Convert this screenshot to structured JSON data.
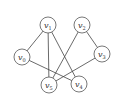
{
  "graph": {
    "nodes": [
      {
        "id": "v0",
        "label": "v",
        "sub": "0",
        "x": 22,
        "y": 57
      },
      {
        "id": "v1",
        "label": "v",
        "sub": "1",
        "x": 48,
        "y": 25
      },
      {
        "id": "v2",
        "label": "v",
        "sub": "2",
        "x": 82,
        "y": 25
      },
      {
        "id": "v3",
        "label": "v",
        "sub": "3",
        "x": 102,
        "y": 54
      },
      {
        "id": "v4",
        "label": "v",
        "sub": "4",
        "x": 79,
        "y": 84
      },
      {
        "id": "v5",
        "label": "v",
        "sub": "5",
        "x": 49,
        "y": 85
      }
    ],
    "edges": [
      [
        "v0",
        "v1"
      ],
      [
        "v0",
        "v4"
      ],
      [
        "v1",
        "v5"
      ],
      [
        "v1",
        "v4"
      ],
      [
        "v2",
        "v5"
      ],
      [
        "v2",
        "v3"
      ],
      [
        "v3",
        "v5"
      ]
    ],
    "node_radius": 8
  }
}
